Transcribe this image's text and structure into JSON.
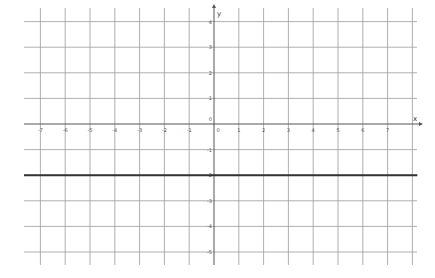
{
  "chart_data": {
    "type": "line",
    "title": "",
    "xlabel": "x",
    "ylabel": "y",
    "xlim": [
      -7.8,
      8.2
    ],
    "ylim": [
      -5.5,
      4.5
    ],
    "grid": true,
    "x_ticks": [
      -7,
      -6,
      -5,
      -4,
      -3,
      -2,
      -1,
      0,
      1,
      2,
      3,
      4,
      5,
      6,
      7
    ],
    "y_ticks": [
      4,
      3,
      2,
      1,
      0,
      -1,
      -2,
      -3,
      -4,
      -5
    ],
    "x_tick_labels": [
      "-7",
      "-6",
      "-5",
      "-4",
      "-3",
      "-2",
      "-1",
      "0",
      "1",
      "2",
      "3",
      "4",
      "5",
      "6",
      "7"
    ],
    "y_tick_labels": [
      "4",
      "3",
      "2",
      "1",
      "0",
      "-1",
      "-2",
      "-3",
      "-4",
      "-5"
    ],
    "series": [
      {
        "name": "y = -2",
        "equation": "y = -2",
        "x": [
          -7.8,
          8.2
        ],
        "values": [
          -2,
          -2
        ],
        "color": "#333333",
        "line_width": 2
      }
    ],
    "colors": {
      "grid": "#9a9a9a",
      "axis": "#555555",
      "line": "#333333",
      "background": "#ffffff"
    }
  }
}
